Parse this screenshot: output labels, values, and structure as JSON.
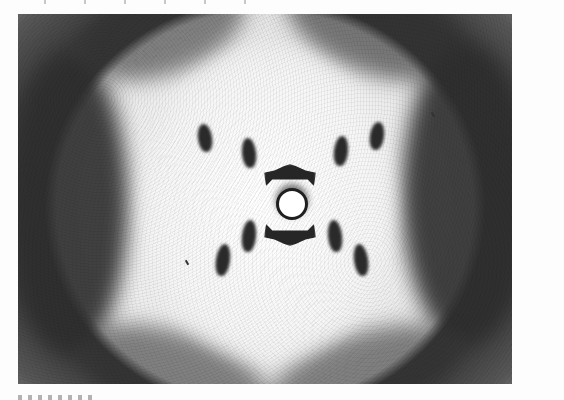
{
  "page": {
    "type": "scanned-book-page",
    "top_text": "",
    "bottom_text": ""
  },
  "figure": {
    "pattern": "X-shaped cross of diffraction spots with central beam-stop ring and dark outer lobes",
    "colors": {
      "background": "#fdfdfd",
      "spots": "#2a2a2a",
      "lobes": "#2e2e2e",
      "center": "#f7f7f7"
    }
  }
}
